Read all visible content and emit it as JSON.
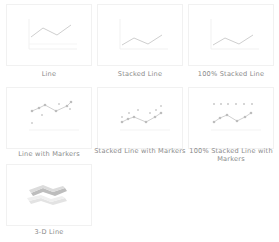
{
  "gallery": {
    "category": "Line",
    "tiles": [
      {
        "id": "line",
        "label": "Line",
        "icon": "line-chart-icon"
      },
      {
        "id": "stacked-line",
        "label": "Stacked Line",
        "icon": "stacked-line-chart-icon"
      },
      {
        "id": "100-stacked-line",
        "label": "100% Stacked Line",
        "icon": "percent-stacked-line-chart-icon"
      },
      {
        "id": "line-markers",
        "label": "Line with Markers",
        "icon": "line-markers-chart-icon"
      },
      {
        "id": "stacked-line-markers",
        "label": "Stacked Line with Markers",
        "icon": "stacked-line-markers-chart-icon"
      },
      {
        "id": "100-stacked-line-markers",
        "label": "100% Stacked Line with Markers",
        "icon": "percent-stacked-line-markers-chart-icon"
      },
      {
        "id": "3d-line",
        "label": "3-D Line",
        "icon": "3d-line-chart-icon"
      }
    ]
  },
  "colors": {
    "line": "#c9c9c9",
    "line_light": "#e2e2e2",
    "marker": "#bdbdbd",
    "border": "#f1f1f1",
    "caption": "#8a8a8a"
  }
}
